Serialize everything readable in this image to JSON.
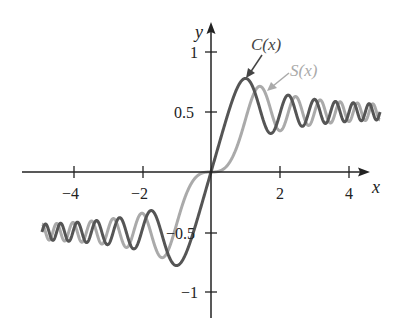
{
  "chart_data": {
    "type": "line",
    "title": "",
    "xlabel": "x",
    "ylabel": "y",
    "xlim": [
      -4.9,
      4.9
    ],
    "ylim": [
      -1.1,
      1.1
    ],
    "grid": false,
    "legend": "inline annotations with arrows",
    "x_ticks": [
      -4,
      -2,
      2,
      4
    ],
    "x_tick_labels": [
      "−4",
      "−2",
      "2",
      "4"
    ],
    "y_ticks": [
      1,
      0.5,
      -0.5,
      -1
    ],
    "y_tick_labels": [
      "1",
      "0.5",
      "−0.5",
      "−1"
    ],
    "series": [
      {
        "name": "C(x)",
        "color": "#555555",
        "function": "C(x) = ∫₀ˣ cos(πt²/2) dt",
        "x": [
          -4,
          -3,
          -2,
          -1.5,
          -1,
          -0.5,
          0,
          0.5,
          1,
          1.5,
          2,
          3,
          4
        ],
        "values": [
          -0.498,
          -0.606,
          -0.488,
          -0.445,
          -0.78,
          -0.492,
          0,
          0.492,
          0.78,
          0.445,
          0.488,
          0.606,
          0.498
        ]
      },
      {
        "name": "S(x)",
        "color": "#aaaaaa",
        "function": "S(x) = ∫₀ˣ sin(πt²/2) dt",
        "x": [
          -4,
          -3,
          -2,
          -1.5,
          -1,
          -0.5,
          0,
          0.5,
          1,
          1.5,
          2,
          3,
          4
        ],
        "values": [
          -0.421,
          -0.496,
          -0.343,
          -0.697,
          -0.438,
          -0.065,
          0,
          0.065,
          0.438,
          0.697,
          0.343,
          0.496,
          0.421
        ]
      }
    ]
  },
  "labels": {
    "x_axis": "x",
    "y_axis": "y",
    "c_label": "C(x)",
    "s_label": "S(x)",
    "tick_x_m4": "−4",
    "tick_x_m2": "−2",
    "tick_x_2": "2",
    "tick_x_4": "4",
    "tick_y_1": "1",
    "tick_y_05": "0.5",
    "tick_y_m05": "−0.5",
    "tick_y_m1": "−1"
  }
}
